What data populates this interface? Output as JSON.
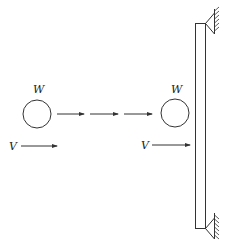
{
  "diagram": {
    "ball_start": {
      "weight_label": "W",
      "velocity_label": "V"
    },
    "ball_impact": {
      "weight_label": "W",
      "velocity_label": "V"
    },
    "motion_arrows_count": 3,
    "beam": {
      "supports": [
        "top-pin",
        "bottom-pin"
      ]
    },
    "colors": {
      "stroke": "#333333",
      "background": "#ffffff"
    }
  }
}
